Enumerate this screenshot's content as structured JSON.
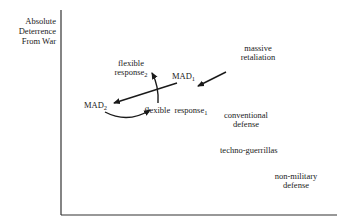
{
  "diagram": {
    "y_axis_label": [
      "Absolute",
      "Deterrence",
      "From War"
    ],
    "x_axis_label": "",
    "nodes": {
      "massive_retaliation": {
        "line1": "massive",
        "line2": "retaliation"
      },
      "mad1": {
        "text": "MAD",
        "sub": "1"
      },
      "flexible_response2": {
        "line1": "flexible",
        "line2": "response",
        "sub": "2"
      },
      "mad2": {
        "text": "MAD",
        "sub": "2"
      },
      "flexible_response1": {
        "text": "flexible  response",
        "sub": "1"
      },
      "conventional_defense": {
        "line1": "conventional",
        "line2": "defense"
      },
      "techno_guerrillas": {
        "text": "techno-guerrillas"
      },
      "non_military_defense": {
        "line1": "non-military",
        "line2": "defense"
      }
    },
    "arrows": [
      {
        "from": "massive retaliation",
        "to": "MAD1",
        "type": "straight"
      },
      {
        "from": "MAD1",
        "to": "MAD2",
        "type": "straight"
      },
      {
        "from": "flexible response1",
        "to": "flexible response2",
        "type": "curved"
      },
      {
        "from": "MAD2",
        "to": "flexible response1",
        "type": "curved"
      }
    ],
    "colors": {
      "ink": "#1a1a1a",
      "axis": "#333333",
      "background": "#ffffff"
    }
  }
}
